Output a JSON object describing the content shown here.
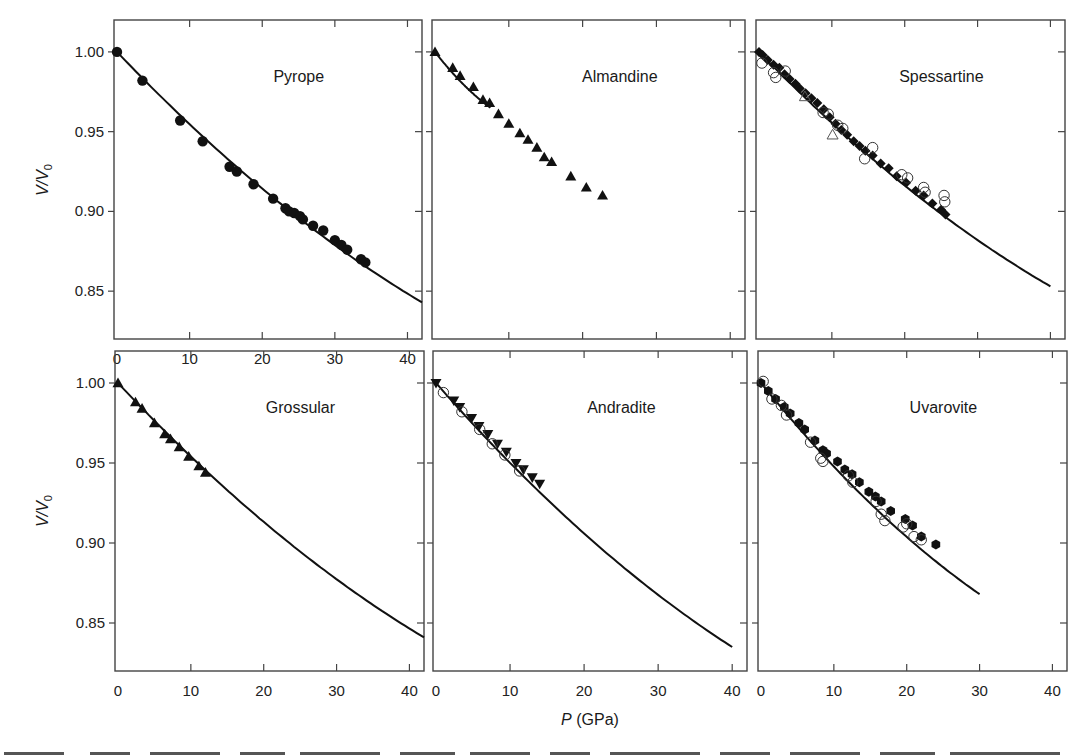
{
  "figure": {
    "ylabel_main": "V/V",
    "ylabel_sub": "0",
    "xlabel_italic": "P",
    "xlabel_rest": " (GPa)",
    "line_color": "#111111",
    "marker_color": "#111111",
    "frame_color": "#444444"
  },
  "chart_data": [
    {
      "type": "scatter",
      "title": "Pyrope",
      "xlabel": "P (GPa)",
      "ylabel": "V/V0",
      "xlim": [
        0,
        42
      ],
      "ylim": [
        0.82,
        1.02
      ],
      "xticks": [
        0,
        10,
        20,
        30,
        40
      ],
      "yticks": [
        0.85,
        0.9,
        0.95,
        1.0
      ],
      "xticklabels": [
        "0",
        "10",
        "20",
        "30",
        "40"
      ],
      "yticklabels": [
        "0.85",
        "0.90",
        "0.95",
        "1.00"
      ],
      "fit_curve": {
        "p_range": [
          0,
          42
        ],
        "v_end": 0.843
      },
      "series": [
        {
          "name": "filled circles",
          "marker": "circle-filled",
          "points": [
            [
              0,
              1.0
            ],
            [
              3.5,
              0.982
            ],
            [
              8.7,
              0.957
            ],
            [
              11.8,
              0.944
            ],
            [
              15.5,
              0.928
            ],
            [
              16.5,
              0.925
            ],
            [
              18.8,
              0.917
            ],
            [
              21.5,
              0.908
            ],
            [
              23.2,
              0.902
            ],
            [
              23.7,
              0.9
            ],
            [
              24.4,
              0.899
            ],
            [
              25.2,
              0.897
            ],
            [
              25.6,
              0.895
            ],
            [
              27.0,
              0.891
            ],
            [
              28.4,
              0.888
            ],
            [
              30.0,
              0.882
            ],
            [
              30.9,
              0.879
            ],
            [
              31.7,
              0.876
            ],
            [
              33.6,
              0.87
            ],
            [
              34.2,
              0.868
            ]
          ]
        }
      ]
    },
    {
      "type": "scatter",
      "title": "Almandine",
      "xlabel": "P (GPa)",
      "ylabel": "V/V0",
      "xlim": [
        0,
        42
      ],
      "ylim": [
        0.82,
        1.02
      ],
      "xticks": [
        0,
        10,
        20,
        30,
        40
      ],
      "yticks": [
        0.85,
        0.9,
        0.95,
        1.0
      ],
      "xticklabels": [],
      "yticklabels": [],
      "fit_curve": {
        "p_range": [
          0,
          7.5
        ],
        "v_end": 0.965
      },
      "series": [
        {
          "name": "filled triangles",
          "marker": "triangle-up-filled",
          "points": [
            [
              0,
              1.0
            ],
            [
              2.4,
              0.99
            ],
            [
              3.4,
              0.985
            ],
            [
              5.2,
              0.978
            ],
            [
              6.5,
              0.97
            ],
            [
              7.4,
              0.968
            ],
            [
              8.6,
              0.961
            ],
            [
              10.0,
              0.955
            ],
            [
              11.5,
              0.949
            ],
            [
              12.6,
              0.945
            ],
            [
              13.8,
              0.94
            ],
            [
              14.8,
              0.934
            ],
            [
              15.8,
              0.931
            ],
            [
              18.4,
              0.922
            ],
            [
              20.5,
              0.915
            ],
            [
              22.7,
              0.91
            ]
          ]
        }
      ]
    },
    {
      "type": "scatter",
      "title": "Spessartine",
      "xlabel": "P (GPa)",
      "ylabel": "V/V0",
      "xlim": [
        0,
        42
      ],
      "ylim": [
        0.82,
        1.02
      ],
      "xticks": [
        0,
        10,
        20,
        30,
        40
      ],
      "yticks": [
        0.85,
        0.9,
        0.95,
        1.0
      ],
      "xticklabels": [],
      "yticklabels": [],
      "fit_curve": {
        "p_range": [
          0,
          40
        ],
        "v_end": 0.853
      },
      "series": [
        {
          "name": "filled diamonds",
          "marker": "diamond-filled",
          "points": [
            [
              0,
              1.0
            ],
            [
              0.5,
              0.998
            ],
            [
              1.2,
              0.995
            ],
            [
              2.0,
              0.992
            ],
            [
              2.8,
              0.99
            ],
            [
              3.5,
              0.986
            ],
            [
              4.2,
              0.983
            ],
            [
              5.0,
              0.98
            ],
            [
              5.6,
              0.977
            ],
            [
              6.4,
              0.974
            ],
            [
              7.2,
              0.971
            ],
            [
              8.0,
              0.968
            ],
            [
              8.9,
              0.964
            ],
            [
              9.7,
              0.959
            ],
            [
              10.5,
              0.955
            ],
            [
              11.3,
              0.951
            ],
            [
              12.1,
              0.948
            ],
            [
              13.0,
              0.944
            ],
            [
              13.8,
              0.941
            ],
            [
              14.6,
              0.938
            ],
            [
              15.6,
              0.935
            ],
            [
              16.7,
              0.93
            ],
            [
              17.8,
              0.927
            ],
            [
              18.9,
              0.922
            ],
            [
              20.2,
              0.918
            ],
            [
              21.5,
              0.913
            ],
            [
              22.6,
              0.91
            ],
            [
              23.8,
              0.905
            ],
            [
              25.0,
              0.901
            ],
            [
              25.6,
              0.898
            ]
          ]
        },
        {
          "name": "open circles",
          "marker": "circle-open",
          "points": [
            [
              0.4,
              0.993
            ],
            [
              2.0,
              0.987
            ],
            [
              2.3,
              0.984
            ],
            [
              3.6,
              0.988
            ],
            [
              8.8,
              0.962
            ],
            [
              9.5,
              0.961
            ],
            [
              10.8,
              0.954
            ],
            [
              11.5,
              0.952
            ],
            [
              15.6,
              0.94
            ],
            [
              14.5,
              0.933
            ],
            [
              19.6,
              0.923
            ],
            [
              20.4,
              0.921
            ],
            [
              22.6,
              0.915
            ],
            [
              22.8,
              0.912
            ],
            [
              25.4,
              0.91
            ],
            [
              25.5,
              0.906
            ]
          ]
        },
        {
          "name": "open triangles",
          "marker": "triangle-up-open",
          "points": [
            [
              6.3,
              0.972
            ],
            [
              10.1,
              0.948
            ]
          ]
        }
      ]
    },
    {
      "type": "scatter",
      "title": "Grossular",
      "xlabel": "P (GPa)",
      "ylabel": "V/V0",
      "xlim": [
        0,
        42
      ],
      "ylim": [
        0.82,
        1.02
      ],
      "xticks": [
        0,
        10,
        20,
        30,
        40
      ],
      "yticks": [
        0.85,
        0.9,
        0.95,
        1.0
      ],
      "xticklabels": [
        "0",
        "10",
        "20",
        "30",
        "40"
      ],
      "yticklabels": [
        "0.85",
        "0.90",
        "0.95",
        "1.00"
      ],
      "fit_curve": {
        "p_range": [
          0,
          42
        ],
        "v_end": 0.841
      },
      "series": [
        {
          "name": "filled triangles",
          "marker": "triangle-up-filled",
          "points": [
            [
              0,
              1.0
            ],
            [
              2.4,
              0.988
            ],
            [
              3.3,
              0.984
            ],
            [
              5.0,
              0.975
            ],
            [
              6.4,
              0.968
            ],
            [
              7.2,
              0.965
            ],
            [
              8.4,
              0.96
            ],
            [
              9.7,
              0.954
            ],
            [
              11.1,
              0.948
            ],
            [
              12.0,
              0.944
            ]
          ]
        }
      ]
    },
    {
      "type": "scatter",
      "title": "Andradite",
      "xlabel": "P (GPa)",
      "ylabel": "V/V0",
      "xlim": [
        0,
        42
      ],
      "ylim": [
        0.82,
        1.02
      ],
      "xticks": [
        0,
        10,
        20,
        30,
        40
      ],
      "yticks": [
        0.85,
        0.9,
        0.95,
        1.0
      ],
      "xticklabels": [
        "0",
        "10",
        "20",
        "30",
        "40"
      ],
      "yticklabels": [],
      "fit_curve": {
        "p_range": [
          0,
          40
        ],
        "v_end": 0.835
      },
      "series": [
        {
          "name": "filled triangles (down)",
          "marker": "triangle-down-filled",
          "points": [
            [
              0,
              1.0
            ],
            [
              2.4,
              0.989
            ],
            [
              3.2,
              0.985
            ],
            [
              4.8,
              0.978
            ],
            [
              5.8,
              0.973
            ],
            [
              7.0,
              0.968
            ],
            [
              8.3,
              0.962
            ],
            [
              9.5,
              0.957
            ],
            [
              10.8,
              0.95
            ],
            [
              11.8,
              0.946
            ],
            [
              13.0,
              0.941
            ],
            [
              14.0,
              0.937
            ]
          ]
        },
        {
          "name": "open circles",
          "marker": "circle-open",
          "points": [
            [
              1.0,
              0.994
            ],
            [
              3.5,
              0.982
            ],
            [
              5.9,
              0.971
            ],
            [
              7.6,
              0.962
            ],
            [
              9.3,
              0.955
            ],
            [
              11.3,
              0.945
            ]
          ]
        }
      ]
    },
    {
      "type": "scatter",
      "title": "Uvarovite",
      "xlabel": "P (GPa)",
      "ylabel": "V/V0",
      "xlim": [
        0,
        42
      ],
      "ylim": [
        0.82,
        1.02
      ],
      "xticks": [
        0,
        10,
        20,
        30,
        40
      ],
      "yticks": [
        0.85,
        0.9,
        0.95,
        1.0
      ],
      "xticklabels": [
        "0",
        "10",
        "20",
        "30",
        "40"
      ],
      "yticklabels": [],
      "fit_curve": {
        "p_range": [
          0,
          30
        ],
        "v_end": 0.868
      },
      "series": [
        {
          "name": "filled hexagons",
          "marker": "hexagon-filled",
          "points": [
            [
              0,
              1.0
            ],
            [
              1.0,
              0.995
            ],
            [
              2.0,
              0.99
            ],
            [
              3.2,
              0.985
            ],
            [
              4.0,
              0.981
            ],
            [
              5.2,
              0.975
            ],
            [
              6.0,
              0.971
            ],
            [
              7.4,
              0.964
            ],
            [
              8.5,
              0.958
            ],
            [
              9.0,
              0.956
            ],
            [
              10.5,
              0.951
            ],
            [
              11.5,
              0.946
            ],
            [
              12.5,
              0.943
            ],
            [
              13.5,
              0.938
            ],
            [
              14.8,
              0.932
            ],
            [
              15.7,
              0.929
            ],
            [
              16.5,
              0.926
            ],
            [
              17.8,
              0.92
            ],
            [
              19.8,
              0.915
            ],
            [
              20.8,
              0.911
            ],
            [
              22.0,
              0.904
            ],
            [
              24.0,
              0.899
            ]
          ]
        },
        {
          "name": "open circles",
          "marker": "circle-open",
          "points": [
            [
              0.3,
              1.001
            ],
            [
              1.5,
              0.99
            ],
            [
              2.8,
              0.986
            ],
            [
              3.5,
              0.98
            ],
            [
              6.8,
              0.963
            ],
            [
              8.2,
              0.953
            ],
            [
              8.5,
              0.951
            ],
            [
              12.0,
              0.942
            ],
            [
              12.6,
              0.938
            ],
            [
              15.8,
              0.926
            ],
            [
              16.5,
              0.918
            ],
            [
              17.0,
              0.914
            ],
            [
              19.5,
              0.91
            ],
            [
              20.0,
              0.912
            ],
            [
              21.0,
              0.904
            ],
            [
              22.0,
              0.902
            ]
          ]
        }
      ]
    }
  ],
  "caption_fragment": "…"
}
